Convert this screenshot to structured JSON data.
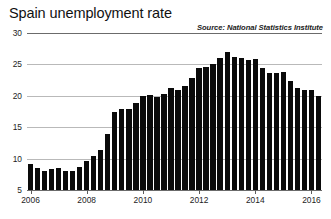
{
  "chart": {
    "title": "Spain unemployment rate",
    "source": "Source: National Statistics Institute"
  },
  "chart_data": {
    "type": "bar",
    "title": "Spain unemployment rate",
    "subtitle": "",
    "annotations": [
      "Source: National Statistics Institute"
    ],
    "xlabel": "",
    "ylabel": "",
    "ylim": [
      5,
      30
    ],
    "yticks": [
      5,
      10,
      15,
      20,
      25,
      30
    ],
    "ytick_labels": [
      "5",
      "10",
      "15",
      "20",
      "25",
      "30"
    ],
    "xticks": [
      2006,
      2008,
      2010,
      2012,
      2014,
      2016
    ],
    "xtick_labels": [
      "2006",
      "2008",
      "2010",
      "2012",
      "2014",
      "2016"
    ],
    "grid": true,
    "legend": "none",
    "bar_color": "#0a0a0a",
    "frequency": "quarterly",
    "categories": [
      "2006 Q1",
      "2006 Q2",
      "2006 Q3",
      "2006 Q4",
      "2007 Q1",
      "2007 Q2",
      "2007 Q3",
      "2007 Q4",
      "2008 Q1",
      "2008 Q2",
      "2008 Q3",
      "2008 Q4",
      "2009 Q1",
      "2009 Q2",
      "2009 Q3",
      "2009 Q4",
      "2010 Q1",
      "2010 Q2",
      "2010 Q3",
      "2010 Q4",
      "2011 Q1",
      "2011 Q2",
      "2011 Q3",
      "2011 Q4",
      "2012 Q1",
      "2012 Q2",
      "2012 Q3",
      "2012 Q4",
      "2013 Q1",
      "2013 Q2",
      "2013 Q3",
      "2013 Q4",
      "2014 Q1",
      "2014 Q2",
      "2014 Q3",
      "2014 Q4",
      "2015 Q1",
      "2015 Q2",
      "2015 Q3",
      "2015 Q4",
      "2016 Q1",
      "2016 Q2"
    ],
    "values": [
      9.1,
      8.5,
      8.1,
      8.3,
      8.5,
      8.0,
      8.0,
      8.6,
      9.6,
      10.4,
      11.3,
      13.9,
      17.4,
      17.9,
      17.9,
      18.8,
      20.0,
      20.1,
      19.8,
      20.3,
      21.3,
      20.9,
      21.5,
      22.9,
      24.4,
      24.6,
      25.0,
      26.0,
      26.9,
      26.2,
      26.0,
      25.7,
      25.9,
      24.5,
      23.7,
      23.7,
      23.8,
      22.4,
      21.2,
      20.9,
      21.0,
      20.0
    ]
  }
}
